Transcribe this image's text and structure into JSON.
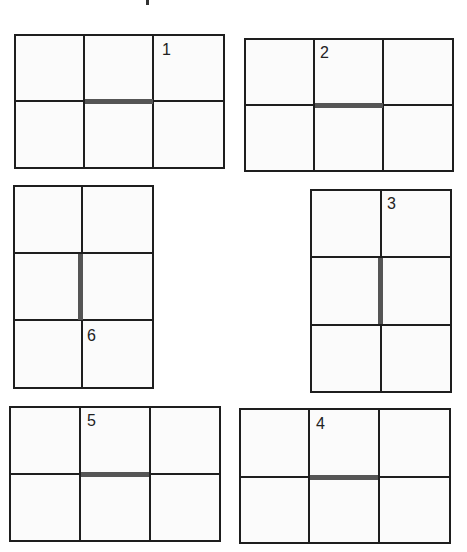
{
  "figures": [
    {
      "id": "fig-1",
      "label": "1",
      "orientation": "landscape",
      "highlight": "horizontal-middle-segment"
    },
    {
      "id": "fig-2",
      "label": "2",
      "orientation": "landscape",
      "highlight": "horizontal-middle-segment"
    },
    {
      "id": "fig-3",
      "label": "3",
      "orientation": "portrait",
      "highlight": "vertical-middle-segment"
    },
    {
      "id": "fig-6",
      "label": "6",
      "orientation": "portrait",
      "highlight": "vertical-middle-segment"
    },
    {
      "id": "fig-5",
      "label": "5",
      "orientation": "landscape",
      "highlight": "horizontal-middle-segment"
    },
    {
      "id": "fig-4",
      "label": "4",
      "orientation": "landscape",
      "highlight": "horizontal-middle-segment"
    }
  ],
  "labels": {
    "f1": "1",
    "f2": "2",
    "f3": "3",
    "f4": "4",
    "f5": "5",
    "f6": "6"
  }
}
